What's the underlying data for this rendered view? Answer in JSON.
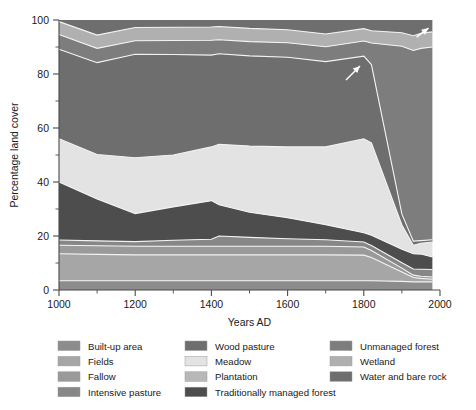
{
  "chart_data": {
    "type": "area",
    "title": "",
    "xlabel": "Years AD",
    "ylabel": "Percentage land cover",
    "xlim": [
      1000,
      2000
    ],
    "ylim": [
      0,
      100
    ],
    "xticks": [
      1000,
      1200,
      1400,
      1600,
      1800,
      2000
    ],
    "xtick_labels": [
      "1000",
      "1200",
      "1400",
      "1600",
      "1800",
      "2000"
    ],
    "yticks": [
      0,
      20,
      40,
      60,
      80,
      100
    ],
    "ytick_labels": [
      "0",
      "20",
      "40",
      "60",
      "80",
      "100"
    ],
    "xminor_step": 100,
    "yminor_step": 10,
    "grid": false,
    "stacked": true,
    "legend_position": "below",
    "x": [
      1000,
      1100,
      1200,
      1300,
      1400,
      1420,
      1500,
      1600,
      1700,
      1800,
      1820,
      1900,
      1930,
      1950,
      1980
    ],
    "series": [
      {
        "name": "Built-up area",
        "color": "#8c8c8c",
        "values": [
          3.4,
          3.4,
          3.4,
          3.4,
          3.4,
          3.4,
          3.4,
          3.4,
          3.4,
          3.4,
          3.4,
          3.2,
          3.0,
          3.0,
          3.0
        ]
      },
      {
        "name": "Fields",
        "color": "#a6a6a6",
        "values": [
          10.0,
          9.8,
          9.6,
          9.6,
          9.6,
          9.6,
          9.6,
          9.6,
          9.6,
          9.5,
          8.6,
          3.5,
          1.6,
          1.3,
          1.0
        ]
      },
      {
        "name": "Fallow",
        "color": "#9a9a9a",
        "values": [
          3.2,
          3.2,
          3.2,
          3.2,
          3.2,
          3.2,
          3.2,
          3.2,
          3.2,
          3.0,
          2.6,
          1.4,
          0.9,
          0.8,
          0.8
        ]
      },
      {
        "name": "Intensive pasture",
        "color": "#878787",
        "values": [
          1.9,
          1.8,
          1.7,
          2.2,
          2.6,
          3.8,
          3.3,
          2.8,
          2.4,
          1.9,
          1.9,
          2.0,
          2.3,
          2.6,
          2.8
        ]
      },
      {
        "name": "Traditionally managed forest",
        "color": "#4d4d4d",
        "values": [
          21.5,
          15.5,
          10.4,
          12.4,
          14.3,
          11.6,
          9.3,
          7.8,
          5.6,
          3.4,
          3.8,
          5.0,
          5.6,
          5.6,
          4.6
        ]
      },
      {
        "name": "Meadow",
        "color": "#e3e3e3",
        "values": [
          16.0,
          16.5,
          20.7,
          19.2,
          19.9,
          22.4,
          24.5,
          26.2,
          28.8,
          34.8,
          34.2,
          9.0,
          3.2,
          4.0,
          5.6
        ]
      },
      {
        "name": "Wood pasture",
        "color": "#6e6e6e",
        "values": [
          33.2,
          34.0,
          38.3,
          37.2,
          34.0,
          33.5,
          33.4,
          33.2,
          31.6,
          30.6,
          29.0,
          4.0,
          1.5,
          1.0,
          0.8
        ]
      },
      {
        "name": "Unmanaged forest",
        "color": "#7d7d7d",
        "values": [
          5.4,
          5.3,
          5.0,
          5.2,
          5.5,
          5.2,
          5.3,
          5.4,
          5.5,
          5.6,
          8.0,
          62.2,
          70.6,
          71.2,
          71.4
        ]
      },
      {
        "name": "Wetland",
        "color": "#b0b0b0",
        "values": [
          4.8,
          4.9,
          4.9,
          4.9,
          4.9,
          4.9,
          4.9,
          4.8,
          4.7,
          4.6,
          4.5,
          5.0,
          5.5,
          5.6,
          5.6
        ]
      },
      {
        "name": "Water and bare rock",
        "color": "#6e6e6e",
        "values": [
          0.6,
          5.6,
          2.8,
          2.7,
          2.6,
          2.4,
          3.1,
          3.6,
          5.2,
          3.2,
          4.0,
          4.7,
          5.8,
          4.9,
          4.4
        ]
      }
    ],
    "annotations": [
      {
        "name": "arrow-1800",
        "label": "",
        "x": 1790,
        "y": 83
      },
      {
        "name": "arrow-top-right",
        "label": "",
        "x": 1970,
        "y": 97
      }
    ]
  },
  "legend": {
    "columns": [
      {
        "items": [
          {
            "label": "Built-up area",
            "color": "#8c8c8c"
          },
          {
            "label": "Fields",
            "color": "#a6a6a6"
          },
          {
            "label": "Fallow",
            "color": "#9a9a9a"
          },
          {
            "label": "Intensive pasture",
            "color": "#878787"
          }
        ]
      },
      {
        "items": [
          {
            "label": "Wood pasture",
            "color": "#6e6e6e"
          },
          {
            "label": "Meadow",
            "color": "#e3e3e3"
          },
          {
            "label": "Plantation",
            "color": "#b8b8b8"
          },
          {
            "label": "Traditionally managed forest",
            "color": "#4d4d4d"
          }
        ]
      },
      {
        "items": [
          {
            "label": "Unmanaged forest",
            "color": "#7d7d7d"
          },
          {
            "label": "Wetland",
            "color": "#b0b0b0"
          },
          {
            "label": "Water and bare rock",
            "color": "#6e6e6e"
          }
        ]
      }
    ]
  }
}
